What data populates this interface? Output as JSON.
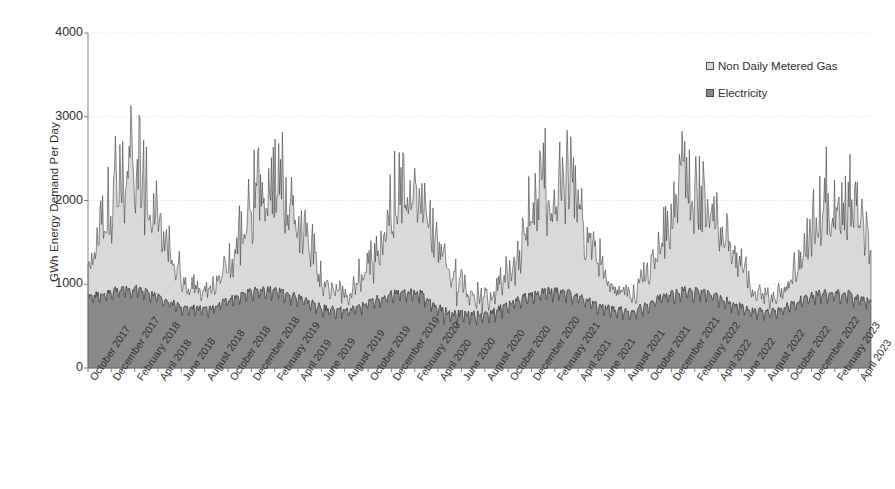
{
  "chart_data": {
    "type": "area",
    "stacked": true,
    "title": "",
    "xlabel": "",
    "ylabel": "GWh Energy Demand Per Day",
    "ylim": [
      0,
      4000
    ],
    "yticks": [
      0,
      1000,
      2000,
      3000,
      4000
    ],
    "grid": true,
    "legend_position": "top-right",
    "legend": [
      "Non Daily Metered Gas",
      "Electricity"
    ],
    "colors": {
      "non_daily_metered_gas": "#d9d9d9",
      "electricity": "#8a8a8a",
      "line": "#333333",
      "axis": "#808080",
      "grid": "#d0d0d0",
      "text": "#2e2e2e"
    },
    "x_range": [
      "October 2017",
      "April 2023"
    ],
    "categories": [
      "October 2017",
      "December 2017",
      "February 2018",
      "April 2018",
      "June 2018",
      "August 2018",
      "October 2018",
      "December 2018",
      "February 2019",
      "April 2019",
      "June 2019",
      "August 2019",
      "October 2019",
      "December 2019",
      "February 2020",
      "April 2020",
      "June 2020",
      "August 2020",
      "October 2020",
      "December 2020",
      "February 2021",
      "April 2021",
      "June 2021",
      "August 2021",
      "October 2021",
      "December 2021",
      "February 2022",
      "April 2022",
      "June 2022",
      "August 2022",
      "October 2022",
      "December 2022",
      "February 2023",
      "April 2023"
    ],
    "series": [
      {
        "name": "Electricity",
        "unit": "GWh per day",
        "monthly_mean": [
          820,
          900,
          930,
          830,
          700,
          680,
          800,
          900,
          910,
          800,
          690,
          660,
          790,
          880,
          880,
          640,
          600,
          640,
          780,
          880,
          900,
          780,
          680,
          660,
          800,
          900,
          890,
          770,
          660,
          650,
          790,
          880,
          860,
          760
        ],
        "monthly_min": [
          700,
          760,
          770,
          690,
          560,
          540,
          660,
          740,
          750,
          640,
          550,
          520,
          640,
          720,
          710,
          430,
          400,
          430,
          620,
          700,
          730,
          600,
          530,
          520,
          640,
          720,
          710,
          600,
          510,
          500,
          630,
          700,
          690,
          600
        ],
        "monthly_max": [
          930,
          1010,
          1030,
          930,
          800,
          780,
          900,
          1000,
          1010,
          900,
          790,
          760,
          890,
          980,
          980,
          760,
          700,
          740,
          880,
          980,
          1000,
          880,
          780,
          760,
          900,
          1000,
          990,
          870,
          760,
          750,
          890,
          980,
          960,
          860
        ]
      },
      {
        "name": "Non Daily Metered Gas",
        "unit": "GWh per day",
        "monthly_mean": [
          300,
          900,
          1080,
          760,
          260,
          180,
          420,
          1000,
          1120,
          700,
          250,
          170,
          430,
          900,
          1000,
          560,
          220,
          170,
          420,
          980,
          1120,
          760,
          260,
          180,
          430,
          980,
          1030,
          660,
          230,
          160,
          380,
          860,
          900,
          620
        ],
        "monthly_min": [
          150,
          520,
          620,
          360,
          90,
          60,
          180,
          560,
          640,
          320,
          80,
          50,
          190,
          500,
          560,
          220,
          70,
          50,
          190,
          540,
          640,
          350,
          90,
          60,
          200,
          540,
          570,
          290,
          70,
          50,
          160,
          460,
          500,
          270
        ],
        "monthly_max": [
          520,
          1700,
          2500,
          1300,
          500,
          330,
          800,
          1900,
          2100,
          1250,
          470,
          310,
          820,
          1800,
          1700,
          980,
          420,
          330,
          800,
          1800,
          2200,
          1300,
          480,
          340,
          830,
          1900,
          1800,
          1150,
          440,
          300,
          720,
          1650,
          1950,
          1100
        ]
      }
    ],
    "stacked_total_peaks": [
      {
        "label": "February 2018",
        "value": 3430
      },
      {
        "label": "January 2019",
        "value": 3000
      },
      {
        "label": "February 2020",
        "value": 2480
      },
      {
        "label": "January 2021",
        "value": 3120
      },
      {
        "label": "December 2021",
        "value": 2830
      },
      {
        "label": "December 2022",
        "value": 2870
      }
    ],
    "stacked_total_troughs": [
      {
        "label": "August 2018",
        "value": 640
      },
      {
        "label": "August 2019",
        "value": 620
      },
      {
        "label": "June 2020",
        "value": 520
      },
      {
        "label": "August 2021",
        "value": 620
      },
      {
        "label": "August 2022",
        "value": 600
      }
    ]
  },
  "axes": {
    "y_title": "GWh Energy Demand Per Day",
    "y_tick_labels": [
      "4000",
      "3000",
      "2000",
      "1000",
      "0"
    ],
    "x_tick_labels": [
      "October 2017",
      "December 2017",
      "February 2018",
      "April 2018",
      "June 2018",
      "August 2018",
      "October 2018",
      "December 2018",
      "February 2019",
      "April 2019",
      "June 2019",
      "August 2019",
      "October 2019",
      "December 2019",
      "February 2020",
      "April 2020",
      "June 2020",
      "August 2020",
      "October 2020",
      "December 2020",
      "February 2021",
      "April 2021",
      "June 2021",
      "August 2021",
      "October 2021",
      "December 2021",
      "February 2022",
      "April 2022",
      "June 2022",
      "August 2022",
      "October 2022",
      "December 2022",
      "February 2023",
      "April 2023"
    ]
  },
  "legend": {
    "items": [
      {
        "label": "Non Daily Metered Gas",
        "swatch": "gas"
      },
      {
        "label": "Electricity",
        "swatch": "elec"
      }
    ]
  }
}
